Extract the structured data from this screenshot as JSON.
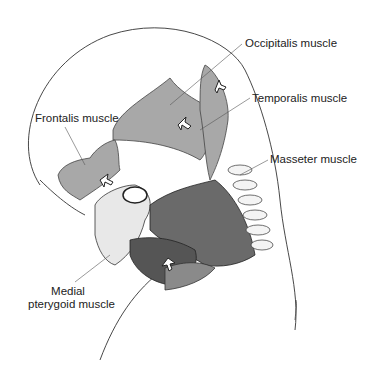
{
  "figure": {
    "colors": {
      "outline": "#333333",
      "muscle_light": "#a8a8a8",
      "muscle_mid": "#8a8a8a",
      "muscle_dark": "#555555",
      "bone": "#e8e8e8",
      "background": "#ffffff"
    }
  },
  "labels": {
    "occipitalis": "Occipitalis muscle",
    "temporalis": "Temporalis muscle",
    "frontalis": "Frontalis muscle",
    "masseter": "Masseter muscle",
    "medial_line1": "Medial",
    "medial_line2": "pterygoid muscle"
  }
}
